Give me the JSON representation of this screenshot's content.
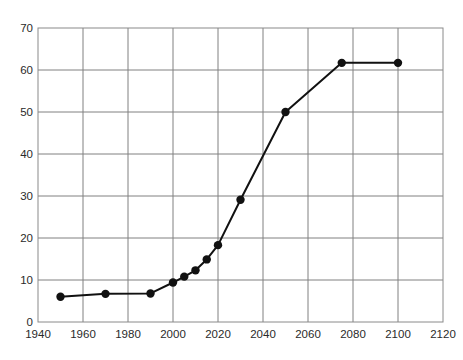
{
  "figure": {
    "top_rule": "horizontal-rule",
    "background_color": "#ffffff"
  },
  "chart_data": {
    "type": "line",
    "title": "",
    "subtitle": "",
    "xlabel": "",
    "ylabel": "",
    "xlim": [
      1940,
      2120
    ],
    "ylim": [
      0,
      70
    ],
    "xticks": [
      1940,
      1960,
      1980,
      2000,
      2020,
      2040,
      2060,
      2080,
      2100,
      2120
    ],
    "yticks": [
      0,
      10,
      20,
      30,
      40,
      50,
      60,
      70
    ],
    "xtick_labels": [
      "1940",
      "1960",
      "1980",
      "2000",
      "2020",
      "2040",
      "2060",
      "2080",
      "2100",
      "2120"
    ],
    "ytick_labels": [
      "0",
      "10",
      "20",
      "30",
      "40",
      "50",
      "60",
      "70"
    ],
    "grid": true,
    "grid_color": "#808080",
    "axis_color": "#808080",
    "legend": null,
    "legend_position": "none",
    "annotations": [],
    "series": [
      {
        "name": "series-1",
        "color": "#111111",
        "marker": "circle",
        "marker_size": 6,
        "line_width": 2,
        "x": [
          1950,
          1970,
          1990,
          2000,
          2005,
          2010,
          2015,
          2020,
          2030,
          2050,
          2075,
          2100
        ],
        "y": [
          6.0,
          6.7,
          6.8,
          9.4,
          10.8,
          12.3,
          14.9,
          18.3,
          29.1,
          50.0,
          61.7,
          61.7
        ],
        "points": [
          {
            "x": 1950,
            "y": 6.0
          },
          {
            "x": 1970,
            "y": 6.7
          },
          {
            "x": 1990,
            "y": 6.8
          },
          {
            "x": 2000,
            "y": 9.4
          },
          {
            "x": 2005,
            "y": 10.8
          },
          {
            "x": 2010,
            "y": 12.3
          },
          {
            "x": 2015,
            "y": 14.9
          },
          {
            "x": 2020,
            "y": 18.3
          },
          {
            "x": 2030,
            "y": 29.1
          },
          {
            "x": 2050,
            "y": 50.0
          },
          {
            "x": 2075,
            "y": 61.7
          },
          {
            "x": 2100,
            "y": 61.7
          }
        ]
      }
    ]
  }
}
